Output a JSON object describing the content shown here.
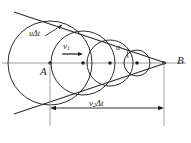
{
  "figure": {
    "type": "geometric-diagram",
    "width": 191,
    "height": 143,
    "background": "#ffffff",
    "stroke_color": "#2b2b2b",
    "axis_color": "#8a8a8a"
  },
  "labels": {
    "point_a": "A",
    "point_b": "B",
    "wave_radius": "uΔt",
    "source_velocity": "v",
    "source_velocity_sub": "1",
    "mach_angle": "α",
    "travel_distance": "v",
    "travel_distance_sub": "2",
    "travel_distance_suffix": "Δt"
  },
  "geometry": {
    "axis": {
      "y": 63,
      "x_start": 2,
      "x_end": 186
    },
    "apex": {
      "x": 164,
      "y": 63,
      "name": "B"
    },
    "circles": [
      {
        "name": "wavefront-1",
        "cx": 50,
        "cy": 63,
        "r": 42
      },
      {
        "name": "wavefront-2",
        "cx": 83,
        "cy": 63,
        "r": 32
      },
      {
        "name": "wavefront-3",
        "cx": 110,
        "cy": 63,
        "r": 23
      },
      {
        "name": "wavefront-4",
        "cx": 137,
        "cy": 63,
        "r": 13
      }
    ],
    "centers": [
      {
        "x": 50,
        "y": 63
      },
      {
        "x": 83,
        "y": 63
      },
      {
        "x": 110,
        "y": 63
      },
      {
        "x": 137,
        "y": 63
      }
    ],
    "tangent_upper": {
      "x1": 14,
      "y1": 12,
      "x2": 164,
      "y2": 63
    },
    "tangent_lower": {
      "x1": 14,
      "y1": 114,
      "x2": 164,
      "y2": 63
    },
    "velocity_arrow": {
      "x1": 62,
      "y1": 54,
      "x2": 82,
      "y2": 54
    },
    "radius_leader": {
      "x1": 47,
      "y1": 36,
      "x2": 63,
      "y2": 24
    },
    "dimension_line": {
      "y": 108,
      "x1": 50,
      "x2": 164
    },
    "drop_line_left": {
      "x": 50,
      "y1": 63,
      "y2": 124
    },
    "drop_line_right": {
      "x": 164,
      "y1": 63,
      "y2": 124
    }
  }
}
